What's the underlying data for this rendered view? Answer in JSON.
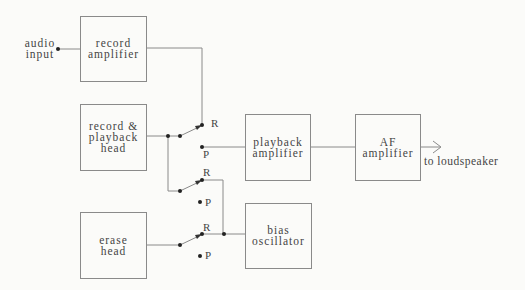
{
  "diagram": {
    "inputs": {
      "audio_input": "audio\ninput"
    },
    "blocks": {
      "record_amplifier": "record\namplifier",
      "record_playback_head": "record &\nplayback\nhead",
      "erase_head": "erase\nhead",
      "playback_amplifier": "playback\namplifier",
      "af_amplifier": "AF\namplifier",
      "bias_oscillator": "bias\noscillator"
    },
    "outputs": {
      "to_loudspeaker": "to loudspeaker"
    },
    "switches": [
      {
        "name": "switch-1",
        "r_label": "R",
        "p_label": "P",
        "position": "R"
      },
      {
        "name": "switch-2",
        "r_label": "R",
        "p_label": "P",
        "position": "R"
      },
      {
        "name": "switch-3",
        "r_label": "R",
        "p_label": "P",
        "position": "R"
      }
    ],
    "colors": {
      "line": "#8a8a8a",
      "text": "#444444",
      "dot": "#222222",
      "background": "#fbfbf9"
    }
  }
}
